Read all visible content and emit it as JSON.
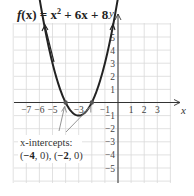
{
  "chart_data": {
    "type": "line",
    "function": "x^2 + 6x + 8",
    "xlabel": "x",
    "ylabel": "y",
    "xlim": [
      -8,
      4
    ],
    "ylim": [
      -6,
      6
    ],
    "grid": true,
    "x_ticks": [
      -7,
      -6,
      -5,
      -3,
      -1,
      1,
      2,
      3
    ],
    "y_ticks": [
      5,
      4,
      3,
      2,
      1,
      -1,
      -2,
      -3,
      -4,
      -5
    ],
    "vertex": {
      "x": -3,
      "y": -1
    },
    "x_intercepts": [
      [
        -4,
        0
      ],
      [
        -2,
        0
      ]
    ],
    "annotation": {
      "label": "x-intercepts:",
      "text": "(−4, 0), (−2, 0)"
    },
    "colors": {
      "curve": "#222222",
      "axes": "#333333",
      "grid": "#d9d9d9",
      "callout": "#888888"
    }
  },
  "title": {
    "f": "f",
    "x": "(x)",
    "eq": " = x",
    "exp": "2",
    "rest": " + 6x + 8"
  },
  "callout": {
    "label": "x-intercepts:",
    "p1": "−4",
    "p1rest": ", 0), (",
    "p2": "−2",
    "p2rest": ", 0)"
  },
  "axes": {
    "x_label": "x",
    "y_label": "y"
  }
}
